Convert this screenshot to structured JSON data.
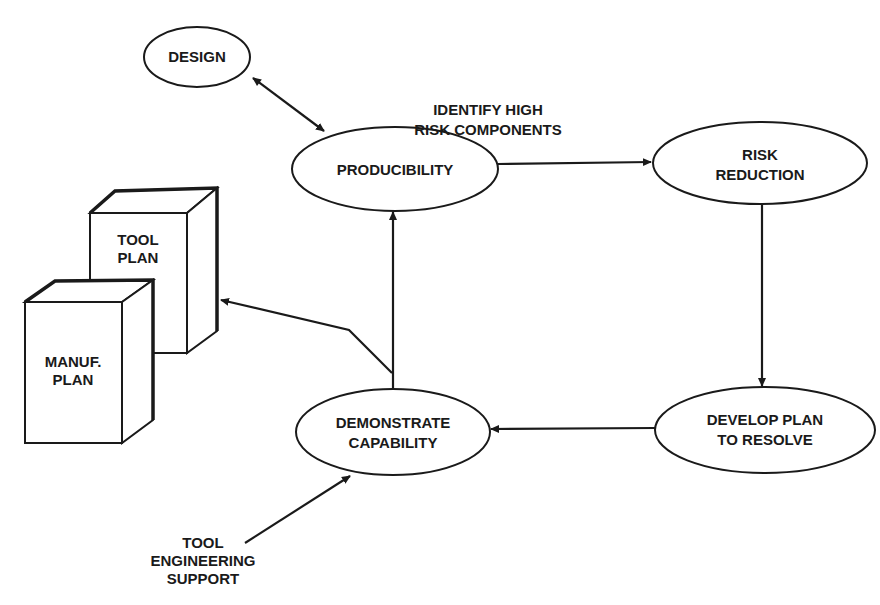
{
  "diagram": {
    "nodes": {
      "design": {
        "lines": [
          "DESIGN"
        ]
      },
      "producibility": {
        "lines": [
          "PRODUCIBILITY"
        ]
      },
      "risk_reduction": {
        "lines": [
          "RISK",
          "REDUCTION"
        ]
      },
      "develop_plan": {
        "lines": [
          "DEVELOP PLAN",
          "TO RESOLVE"
        ]
      },
      "demonstrate": {
        "lines": [
          "DEMONSTRATE",
          "CAPABILITY"
        ]
      },
      "tool_plan": {
        "lines": [
          "TOOL",
          "PLAN"
        ]
      },
      "manuf_plan": {
        "lines": [
          "MANUF.",
          "PLAN"
        ]
      }
    },
    "edge_labels": {
      "identify": [
        "IDENTIFY HIGH",
        "RISK COMPONENTS"
      ],
      "tool_support": [
        "TOOL",
        "ENGINEERING",
        "SUPPORT"
      ]
    },
    "edges": [
      {
        "from": "design",
        "to": "producibility",
        "type": "bidirectional"
      },
      {
        "from": "producibility",
        "to": "risk_reduction",
        "label": "identify"
      },
      {
        "from": "risk_reduction",
        "to": "develop_plan"
      },
      {
        "from": "develop_plan",
        "to": "demonstrate"
      },
      {
        "from": "demonstrate",
        "to": "producibility"
      },
      {
        "from": "demonstrate",
        "to": "tool_plan"
      },
      {
        "from": "tool_support",
        "to": "demonstrate"
      }
    ],
    "colors": {
      "ink": "#1a1a1a",
      "background": "#ffffff"
    }
  }
}
